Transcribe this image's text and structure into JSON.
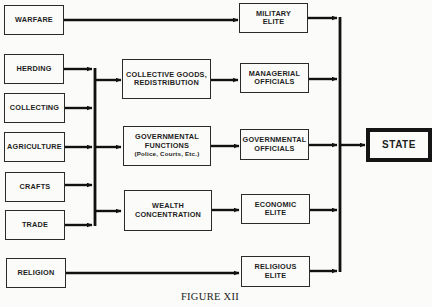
{
  "diagram": {
    "sources": [
      {
        "id": "warfare",
        "label": "WARFARE"
      },
      {
        "id": "herding",
        "label": "HERDING"
      },
      {
        "id": "collecting",
        "label": "COLLECTING"
      },
      {
        "id": "agriculture",
        "label": "AGRICULTURE"
      },
      {
        "id": "crafts",
        "label": "CRAFTS"
      },
      {
        "id": "trade",
        "label": "TRADE"
      },
      {
        "id": "religion",
        "label": "RELIGION"
      }
    ],
    "processes": [
      {
        "id": "collective-goods",
        "lines": [
          "COLLECTIVE GOODS,",
          "REDISTRIBUTION"
        ]
      },
      {
        "id": "governmental-functions",
        "lines": [
          "GOVERNMENTAL",
          "FUNCTIONS"
        ],
        "note": "(Police, Courts, Etc.)"
      },
      {
        "id": "wealth-concentration",
        "lines": [
          "WEALTH",
          "CONCENTRATION"
        ]
      }
    ],
    "elites": [
      {
        "id": "military-elite",
        "lines": [
          "MILITARY",
          "ELITE"
        ]
      },
      {
        "id": "managerial-officials",
        "lines": [
          "MANAGERIAL",
          "OFFICIALS"
        ]
      },
      {
        "id": "governmental-officials",
        "lines": [
          "GOVERNMENTAL",
          "OFFICIALS"
        ]
      },
      {
        "id": "economic-elite",
        "lines": [
          "ECONOMIC",
          "ELITE"
        ]
      },
      {
        "id": "religious-elite",
        "lines": [
          "RELIGIOUS",
          "ELITE"
        ]
      }
    ],
    "target": {
      "id": "state",
      "label": "STATE"
    },
    "edges": [
      [
        "warfare",
        "military-elite"
      ],
      [
        "herding",
        "economic-bus"
      ],
      [
        "collecting",
        "economic-bus"
      ],
      [
        "agriculture",
        "economic-bus"
      ],
      [
        "crafts",
        "economic-bus"
      ],
      [
        "trade",
        "economic-bus"
      ],
      [
        "economic-bus",
        "collective-goods"
      ],
      [
        "economic-bus",
        "governmental-functions"
      ],
      [
        "economic-bus",
        "wealth-concentration"
      ],
      [
        "collective-goods",
        "managerial-officials"
      ],
      [
        "governmental-functions",
        "governmental-officials"
      ],
      [
        "wealth-concentration",
        "economic-elite"
      ],
      [
        "religion",
        "religious-elite"
      ],
      [
        "military-elite",
        "state"
      ],
      [
        "managerial-officials",
        "state"
      ],
      [
        "governmental-officials",
        "state"
      ],
      [
        "economic-elite",
        "state"
      ],
      [
        "religious-elite",
        "state"
      ]
    ]
  },
  "caption": "FIGURE XII"
}
